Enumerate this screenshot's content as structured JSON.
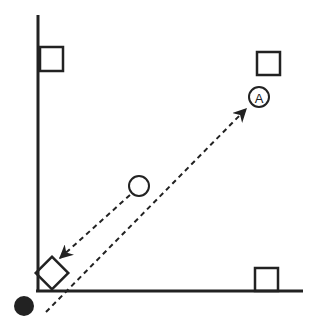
{
  "diagram": {
    "colors": {
      "stroke": "#222222",
      "background": "#ffffff"
    },
    "axes": {
      "vertical": {
        "x": 38,
        "y1": 15,
        "y2": 292
      },
      "horizontal": {
        "y": 291,
        "x1": 36,
        "x2": 303
      }
    },
    "squares": [
      {
        "id": "top-left",
        "x": 40,
        "y": 47,
        "w": 23,
        "h": 24
      },
      {
        "id": "top-right",
        "x": 257,
        "y": 52,
        "w": 23,
        "h": 23
      },
      {
        "id": "bottom-right",
        "x": 255,
        "y": 268,
        "w": 23,
        "h": 23
      }
    ],
    "rotated_square": {
      "cx": 52,
      "cy": 273,
      "size": 23,
      "angle": 45
    },
    "open_circle": {
      "cx": 139,
      "cy": 186,
      "r": 10
    },
    "labeled_circle": {
      "cx": 259,
      "cy": 97,
      "r": 10,
      "label": "A"
    },
    "filled_dot": {
      "cx": 24,
      "cy": 306,
      "r": 10
    },
    "dashed_arrows": [
      {
        "from": [
          130,
          195
        ],
        "to": [
          60,
          258
        ],
        "arrowhead": "end"
      },
      {
        "from": [
          46,
          312
        ],
        "to": [
          246,
          109
        ],
        "arrowhead": "end"
      }
    ]
  }
}
